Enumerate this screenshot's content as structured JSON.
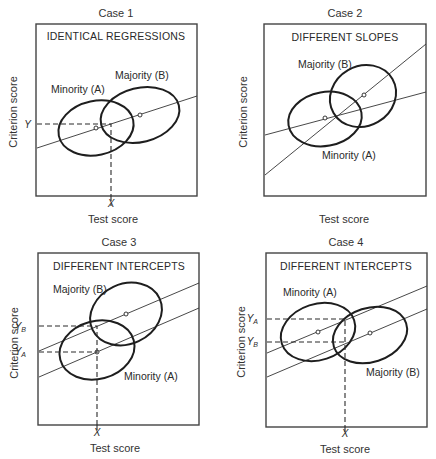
{
  "figure": {
    "panels": [
      {
        "case_label": "Case 1",
        "box_title": "IDENTICAL REGRESSIONS",
        "x_axis_label": "Test score",
        "y_axis_label": "Criterion score",
        "groups": [
          {
            "label": "Minority (A)",
            "role": "minority"
          },
          {
            "label": "Majority (B)",
            "role": "majority"
          }
        ],
        "ticks": {
          "x": "X",
          "y": [
            "Y"
          ]
        }
      },
      {
        "case_label": "Case 2",
        "box_title": "DIFFERENT SLOPES",
        "x_axis_label": "Test score",
        "y_axis_label": "Criterion score",
        "groups": [
          {
            "label": "Majority (B)",
            "role": "majority"
          },
          {
            "label": "Minority (A)",
            "role": "minority"
          }
        ],
        "ticks": {
          "x": "",
          "y": []
        }
      },
      {
        "case_label": "Case 3",
        "box_title": "DIFFERENT INTERCEPTS",
        "x_axis_label": "Test score",
        "y_axis_label": "Criterion score",
        "groups": [
          {
            "label": "Majority (B)",
            "role": "majority"
          },
          {
            "label": "Minority (A)",
            "role": "minority"
          }
        ],
        "ticks": {
          "x": "X",
          "y": [
            "Y",
            "Y"
          ],
          "y_subscripts": [
            "B",
            "A"
          ]
        }
      },
      {
        "case_label": "Case 4",
        "box_title": "DIFFERENT INTERCEPTS",
        "x_axis_label": "Test score",
        "y_axis_label": "Criterion score",
        "groups": [
          {
            "label": "Minority (A)",
            "role": "minority"
          },
          {
            "label": "Majority (B)",
            "role": "majority"
          }
        ],
        "ticks": {
          "x": "X",
          "y": [
            "Y",
            "Y"
          ],
          "y_subscripts": [
            "A",
            "B"
          ]
        }
      }
    ]
  }
}
